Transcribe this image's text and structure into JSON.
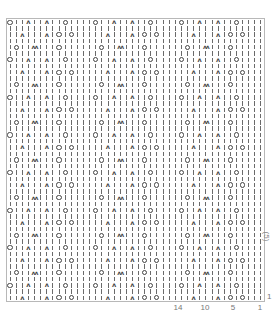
{
  "chart_data": {
    "type": "knitting-chart",
    "title": "",
    "columns": 42,
    "rows": 45,
    "stitch_repeat": 14,
    "row_repeat": 6,
    "legend_symbols": {
      "|": "knit",
      "O": "yarn over",
      "A": "decrease (k2tog/ssk)",
      "W": "double decrease"
    },
    "row_patterns": [
      "O||A||A||O||||",
      "||||||||||||||",
      "||A|||A|O|O|||",
      "||||||||||||||",
      "|O||W|||O|||||",
      "||||||||||||||"
    ],
    "x_ticks": [
      {
        "label": "14",
        "col": 14
      },
      {
        "label": "10",
        "col": 10
      },
      {
        "label": "5",
        "col": 5
      },
      {
        "label": "1",
        "col": 1
      }
    ],
    "y_ticks": [
      {
        "label": "1",
        "row": 1
      }
    ],
    "y_side_label": "(5)"
  }
}
